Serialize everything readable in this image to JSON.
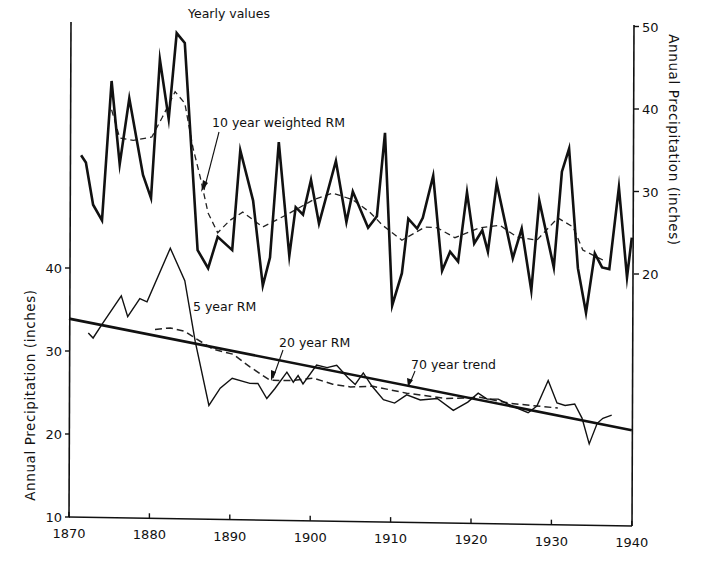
{
  "chart_data": {
    "type": "line",
    "title": "",
    "xlabel": "",
    "x_ticks": [
      "1870",
      "1880",
      "1890",
      "1900",
      "1910",
      "1920",
      "1930",
      "1940"
    ],
    "xlim": [
      1870,
      1940
    ],
    "left_axis": {
      "label": "Annual Precipitation (inches)",
      "ticks": [
        "10",
        "20",
        "30",
        "40"
      ],
      "ylim": [
        10,
        43.5
      ]
    },
    "right_axis": {
      "label": "Annual Precipitation (inches)",
      "ticks": [
        "20",
        "30",
        "40",
        "50"
      ],
      "ylim": [
        15,
        50
      ]
    },
    "grid": false,
    "legend": "none (inline annotations)",
    "annotations": {
      "yearly": "Yearly values",
      "rm10": "10 year weighted RM",
      "rm5": "5 year RM",
      "rm20": "20 year RM",
      "trend": "70 year trend"
    },
    "series": [
      {
        "name": "Yearly values",
        "axis": "right",
        "style": "solid-thick",
        "x": [
          1871.5,
          1872.1,
          1873.0,
          1874.1,
          1875.3,
          1876.3,
          1877.5,
          1879.2,
          1880.2,
          1881.3,
          1882.4,
          1883.4,
          1884.4,
          1886.0,
          1887.3,
          1888.5,
          1890.3,
          1891.3,
          1892.9,
          1894.1,
          1895.0,
          1896.1,
          1897.4,
          1898.2,
          1899.1,
          1900.1,
          1901.1,
          1903.2,
          1904.5,
          1905.3,
          1907.2,
          1908.3,
          1909.3,
          1910.2,
          1911.4,
          1912.2,
          1913.3,
          1914.0,
          1915.3,
          1916.4,
          1917.4,
          1918.4,
          1919.5,
          1920.4,
          1921.4,
          1922.1,
          1923.2,
          1925.2,
          1926.3,
          1927.5,
          1928.5,
          1930.3,
          1931.3,
          1932.2,
          1933.3,
          1934.3,
          1935.4,
          1936.3,
          1937.2,
          1938.4,
          1939.4,
          1940.0
        ],
        "values": [
          34.4,
          33.5,
          28.4,
          26.5,
          43.4,
          33.3,
          41.3,
          32.0,
          29.2,
          46.0,
          38.8,
          49.2,
          48.0,
          22.9,
          20.7,
          24.5,
          22.9,
          35.0,
          28.9,
          18.6,
          22.0,
          36.0,
          22.2,
          28.1,
          27.2,
          31.4,
          26.1,
          33.7,
          26.3,
          30.0,
          25.6,
          27.0,
          37.1,
          16.2,
          20.1,
          26.7,
          25.5,
          26.8,
          31.9,
          20.4,
          22.7,
          21.5,
          29.9,
          23.7,
          25.3,
          22.7,
          31.0,
          21.9,
          25.5,
          18.0,
          28.9,
          20.8,
          32.4,
          35.2,
          20.7,
          15.3,
          22.5,
          20.8,
          20.6,
          30.5,
          19.6,
          24.4
        ]
      },
      {
        "name": "10 year weighted RM",
        "axis": "right",
        "style": "dashed",
        "x": [
          1875.3,
          1876.3,
          1878.0,
          1880.3,
          1881.6,
          1883.2,
          1884.4,
          1885.4,
          1886.3,
          1887.3,
          1888.5,
          1890.0,
          1891.6,
          1894.1,
          1897.1,
          1900.4,
          1902.8,
          1905.3,
          1907.4,
          1909.0,
          1911.4,
          1914.3,
          1915.8,
          1918.0,
          1921.1,
          1923.6,
          1925.7,
          1928.2,
          1930.8,
          1932.7,
          1933.9,
          1936.4
        ],
        "values": [
          39.9,
          36.5,
          36.2,
          36.6,
          39.0,
          42.1,
          40.7,
          35.4,
          31.8,
          27.4,
          25.0,
          26.5,
          27.5,
          25.7,
          27.2,
          29.0,
          29.8,
          29.0,
          27.5,
          25.9,
          24.1,
          25.7,
          25.6,
          24.4,
          25.6,
          25.9,
          24.5,
          24.1,
          26.8,
          25.7,
          22.9,
          21.7
        ]
      },
      {
        "name": "5 year RM",
        "axis": "left",
        "style": "solid-thin",
        "x": [
          1872.4,
          1873.0,
          1874.2,
          1876.5,
          1877.3,
          1878.8,
          1879.7,
          1882.6,
          1884.4,
          1885.7,
          1887.4,
          1888.8,
          1890.3,
          1892.5,
          1893.5,
          1894.6,
          1895.6,
          1897.1,
          1897.9,
          1898.5,
          1899.1,
          1900.8,
          1902.1,
          1903.3,
          1904.7,
          1905.6,
          1906.6,
          1907.7,
          1909.1,
          1910.5,
          1912.0,
          1913.7,
          1915.8,
          1917.8,
          1919.6,
          1920.9,
          1922.0,
          1923.4,
          1924.6,
          1925.8,
          1927.1,
          1928.2,
          1929.6,
          1930.7,
          1931.7,
          1932.9,
          1933.8,
          1934.7,
          1935.7,
          1936.4,
          1937.5
        ],
        "values": [
          32.2,
          31.6,
          33.4,
          36.7,
          34.2,
          36.4,
          36.0,
          42.5,
          38.6,
          31.3,
          23.6,
          25.7,
          26.9,
          26.3,
          26.3,
          24.5,
          25.7,
          27.7,
          26.5,
          27.3,
          26.3,
          28.6,
          28.3,
          28.6,
          27.1,
          26.3,
          27.7,
          26.1,
          24.5,
          24.1,
          25.1,
          24.5,
          24.7,
          23.3,
          24.3,
          25.4,
          24.7,
          24.7,
          24.1,
          23.6,
          23.1,
          23.9,
          27.0,
          24.3,
          24.0,
          24.2,
          22.5,
          19.4,
          21.9,
          22.5,
          22.9
        ]
      },
      {
        "name": "20 year RM",
        "axis": "left",
        "style": "dashed",
        "x": [
          1880.7,
          1882.6,
          1884.4,
          1885.7,
          1887.9,
          1890.4,
          1892.5,
          1895.0,
          1897.9,
          1900.4,
          1902.8,
          1905.0,
          1907.8,
          1912.0,
          1917.0,
          1921.1,
          1924.9,
          1930.8
        ],
        "values": [
          32.7,
          32.9,
          32.5,
          31.7,
          30.4,
          29.8,
          28.3,
          26.7,
          26.7,
          27.0,
          26.3,
          26.0,
          26.1,
          25.3,
          24.7,
          24.9,
          24.2,
          23.7
        ]
      },
      {
        "name": "70 year trend",
        "axis": "left",
        "style": "solid-thick",
        "x": [
          1870.0,
          1940.0
        ],
        "values": [
          33.9,
          21.1
        ]
      }
    ]
  }
}
